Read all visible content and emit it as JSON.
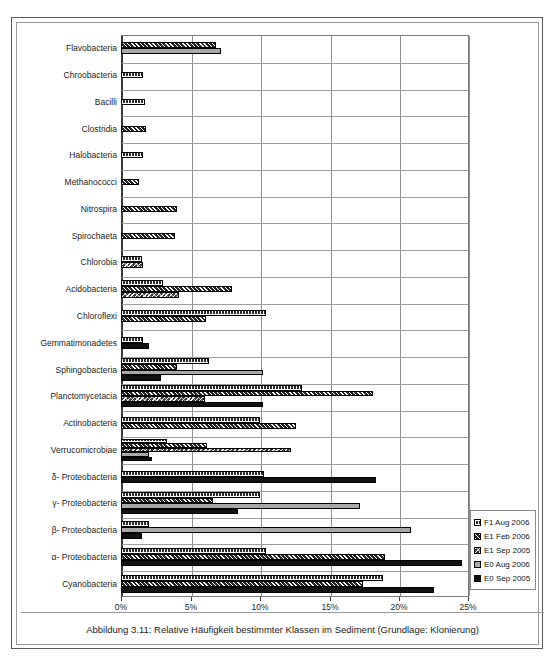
{
  "figure": {
    "caption": "Abbildung 3.11: Relative Häufigkeit bestimmter Klassen im Sediment (Grundlage: Klonierung)"
  },
  "legend": {
    "position": "bottom-right",
    "items": [
      {
        "label": "F1 Aug 2006",
        "pattern": "p-f1aug"
      },
      {
        "label": "E1 Feb 2006",
        "pattern": "p-e1feb"
      },
      {
        "label": "E1 Sep 2005",
        "pattern": "p-e1sep"
      },
      {
        "label": "E0 Aug 2006",
        "pattern": "p-e0aug"
      },
      {
        "label": "E0 Sep 2005",
        "pattern": "p-e0sep"
      }
    ]
  },
  "chart_data": {
    "type": "bar",
    "orientation": "horizontal",
    "title": "",
    "subtitle": "",
    "xlabel": "",
    "ylabel": "",
    "xlim": [
      0,
      25
    ],
    "xticks": [
      0,
      5,
      10,
      15,
      20,
      25
    ],
    "xtick_labels": [
      "0%",
      "5%",
      "10%",
      "15%",
      "20%",
      "25%"
    ],
    "grid": "vertical-and-horizontal",
    "unit": "%",
    "categories": [
      "Flavobacteria",
      "Chroobacteria",
      "Bacilli",
      "Clostridia",
      "Halobacteria",
      "Methanococci",
      "Nitrospira",
      "Spirochaeta",
      "Chlorobia",
      "Acidobacteria",
      "Chloroflexi",
      "Gemmatimonadetes",
      "Sphingobacteria",
      "Planctomycetacia",
      "Actinobacteria",
      "Verrucomicrobiae",
      "δ- Proteobacteria",
      "γ- Proteobacteria",
      "β- Proteobacteria",
      "α- Proteobacteria",
      "Cyanobacteria"
    ],
    "series": [
      {
        "name": "F1 Aug 2006",
        "pattern": "p-f1aug",
        "values": [
          0,
          1.6,
          1.7,
          0,
          1.6,
          0,
          0,
          0,
          1.5,
          3.0,
          10.4,
          1.6,
          6.3,
          13.0,
          10.0,
          3.3,
          10.3,
          10.0,
          2.0,
          10.4,
          18.8
        ]
      },
      {
        "name": "E1 Feb 2006",
        "pattern": "p-e1feb",
        "values": [
          6.8,
          0,
          0,
          1.8,
          0,
          1.3,
          4.0,
          3.9,
          0,
          8.0,
          6.1,
          0,
          4.0,
          18.1,
          12.6,
          6.2,
          0,
          6.6,
          0,
          19.0,
          17.4
        ]
      },
      {
        "name": "E1 Sep 2005",
        "pattern": "p-e1sep",
        "values": [
          0,
          0,
          0,
          0,
          0,
          0,
          0,
          0,
          1.6,
          4.2,
          0,
          0,
          0,
          6.0,
          0,
          12.2,
          0,
          0,
          0,
          0,
          0
        ]
      },
      {
        "name": "E0 Aug 2006",
        "pattern": "p-e0aug",
        "values": [
          7.2,
          0,
          0,
          0,
          0,
          0,
          0,
          0,
          0,
          0,
          0,
          0,
          10.2,
          0,
          0,
          2.0,
          0,
          17.2,
          20.8,
          0,
          0
        ]
      },
      {
        "name": "E0 Sep 2005",
        "pattern": "p-e0sep",
        "values": [
          0,
          0,
          0,
          0,
          0,
          0,
          0,
          0,
          0,
          0,
          0,
          2.0,
          2.9,
          10.2,
          0,
          2.2,
          18.3,
          8.4,
          1.5,
          24.5,
          22.5
        ]
      }
    ]
  }
}
